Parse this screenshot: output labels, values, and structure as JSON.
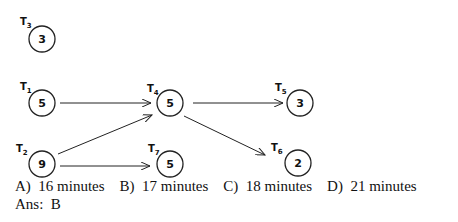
{
  "nodes": [
    {
      "id": "T3",
      "label": "T",
      "sub": "3",
      "value": "3",
      "cx": 42,
      "cy": 39
    },
    {
      "id": "T1",
      "label": "T",
      "sub": "1",
      "value": "5",
      "cx": 42,
      "cy": 103
    },
    {
      "id": "T4",
      "label": "T",
      "sub": "4",
      "value": "5",
      "cx": 170,
      "cy": 103
    },
    {
      "id": "T5",
      "label": "T",
      "sub": "5",
      "value": "3",
      "cx": 300,
      "cy": 103
    },
    {
      "id": "T2",
      "label": "T",
      "sub": "2",
      "value": "9",
      "cx": 42,
      "cy": 164
    },
    {
      "id": "T7",
      "label": "T",
      "sub": "7",
      "value": "5",
      "cx": 170,
      "cy": 164
    },
    {
      "id": "T6",
      "label": "T",
      "sub": "6",
      "value": "2",
      "cx": 298,
      "cy": 164
    }
  ],
  "edges": [
    {
      "from": "T1",
      "to": "T4"
    },
    {
      "from": "T2",
      "to": "T4"
    },
    {
      "from": "T2",
      "to": "T7"
    },
    {
      "from": "T4",
      "to": "T5"
    },
    {
      "from": "T4",
      "to": "T6"
    }
  ],
  "options": [
    {
      "letter": "A)",
      "text": "16 minutes"
    },
    {
      "letter": "B)",
      "text": "17 minutes"
    },
    {
      "letter": "C)",
      "text": "18 minutes"
    },
    {
      "letter": "D)",
      "text": "21 minutes"
    }
  ],
  "answer": {
    "label": "Ans:",
    "value": "B"
  }
}
